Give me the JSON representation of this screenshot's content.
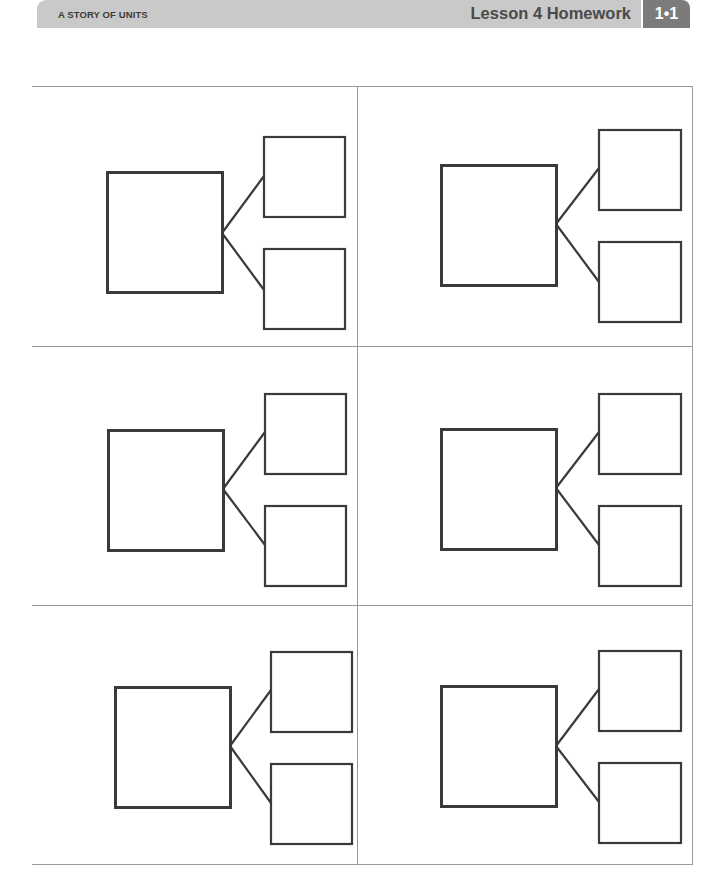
{
  "header": {
    "series_title": "A STORY OF UNITS",
    "lesson_title": "Lesson 4 Homework",
    "badge": "1•1",
    "colors": {
      "header_bar": "#c9c9c9",
      "badge": "#7b7b7b",
      "badge_text": "#ffffff"
    }
  },
  "worksheet": {
    "layout": "3 rows × 2 columns grid of number bonds",
    "grid_line_color": "#9a9a9a",
    "box_stroke_color": "#3a3a3a",
    "number_bonds": [
      {
        "whole": "",
        "part_top": "",
        "part_bottom": ""
      },
      {
        "whole": "",
        "part_top": "",
        "part_bottom": ""
      },
      {
        "whole": "",
        "part_top": "",
        "part_bottom": ""
      },
      {
        "whole": "",
        "part_top": "",
        "part_bottom": ""
      },
      {
        "whole": "",
        "part_top": "",
        "part_bottom": ""
      },
      {
        "whole": "",
        "part_top": "",
        "part_bottom": ""
      }
    ]
  }
}
